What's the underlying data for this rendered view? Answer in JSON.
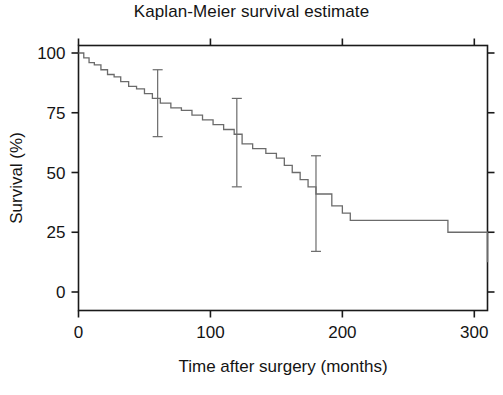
{
  "figure": {
    "title": "Kaplan-Meier survival estimate",
    "background_color": "#ffffff",
    "line_color": "#6b6b6b",
    "text_color": "#141414"
  },
  "chart_data": {
    "type": "line",
    "subtype": "kaplan-meier-step",
    "title": "Kaplan-Meier survival estimate",
    "xlabel": "Time after surgery (months)",
    "ylabel": "Survival (%)",
    "xlim": [
      0,
      310
    ],
    "ylim": [
      0,
      105
    ],
    "xticks": [
      0,
      100,
      200,
      300
    ],
    "xtick_labels": [
      "0",
      "100",
      "200",
      "300"
    ],
    "yticks": [
      0,
      25,
      50,
      75,
      100
    ],
    "ytick_labels": [
      "0",
      "25",
      "50",
      "75",
      "100"
    ],
    "grid": false,
    "legend": null,
    "series": [
      {
        "name": "Survival probability",
        "step_type": "post",
        "x": [
          0,
          4,
          8,
          12,
          17,
          22,
          27,
          32,
          38,
          44,
          50,
          56,
          62,
          70,
          78,
          86,
          94,
          102,
          110,
          118,
          124,
          132,
          142,
          150,
          156,
          162,
          168,
          174,
          180,
          192,
          200,
          206,
          280,
          310
        ],
        "y": [
          100,
          98,
          96,
          95,
          93,
          91,
          90,
          88,
          86,
          85,
          83,
          81,
          79,
          77,
          76,
          74,
          72,
          70,
          68,
          66,
          62,
          60,
          58,
          56,
          53,
          50,
          47,
          44,
          41,
          36,
          33,
          30,
          25,
          12.5
        ]
      }
    ],
    "error_bars": [
      {
        "x": 60,
        "y": 79,
        "lower": 65,
        "upper": 93,
        "label": "95% CI at 60 months"
      },
      {
        "x": 120,
        "y": 62,
        "lower": 44,
        "upper": 81,
        "label": "95% CI at 120 months"
      },
      {
        "x": 180,
        "y": 37,
        "lower": 17,
        "upper": 57,
        "label": "95% CI at 180 months"
      }
    ]
  }
}
